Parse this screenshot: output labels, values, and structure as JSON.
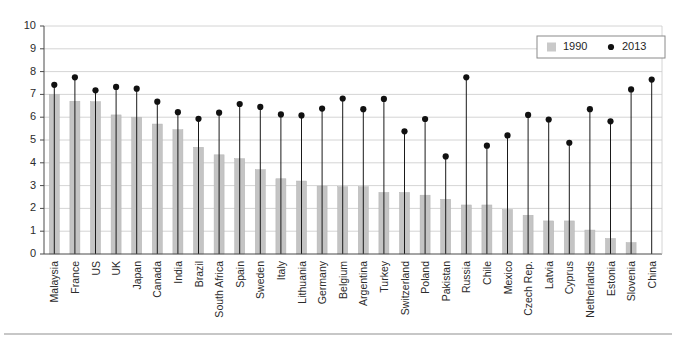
{
  "chart_data": {
    "type": "bar",
    "title": "",
    "xlabel": "",
    "ylabel": "",
    "ylim": [
      0,
      10
    ],
    "ytick_labels": [
      "0",
      "1",
      "2",
      "3",
      "4",
      "5",
      "6",
      "7",
      "8",
      "9",
      "10"
    ],
    "yticks": [
      0,
      1,
      2,
      3,
      4,
      5,
      6,
      7,
      8,
      9,
      10
    ],
    "grid": true,
    "legend_position": "top-right",
    "legend": [
      {
        "name": "1990",
        "marker": "square",
        "color": "#c9c9c9"
      },
      {
        "name": "2013",
        "marker": "dot",
        "color": "#111111"
      }
    ],
    "categories": [
      "Malaysia",
      "France",
      "US",
      "UK",
      "Japan",
      "Canada",
      "India",
      "Brazil",
      "South Africa",
      "Spain",
      "Sweden",
      "Italy",
      "Lithuania",
      "Germany",
      "Belgium",
      "Argentina",
      "Turkey",
      "Switzerland",
      "Poland",
      "Pakistan",
      "Russia",
      "Chile",
      "Mexico",
      "Czech Rep.",
      "Latvia",
      "Cyprus",
      "Netherlands",
      "Estonia",
      "Slovenia",
      "China"
    ],
    "series": [
      {
        "name": "1990",
        "type": "bar",
        "values": [
          7.0,
          6.7,
          6.68,
          6.1,
          6.0,
          5.7,
          5.45,
          4.68,
          4.35,
          4.18,
          3.7,
          3.3,
          3.2,
          2.98,
          2.95,
          2.95,
          2.7,
          2.7,
          2.58,
          2.4,
          2.15,
          2.15,
          1.95,
          1.7,
          1.45,
          1.45,
          1.05,
          0.68,
          0.5,
          0.0
        ]
      },
      {
        "name": "2013",
        "type": "scatter",
        "values": [
          7.42,
          7.75,
          7.18,
          7.33,
          7.25,
          6.68,
          6.22,
          5.93,
          6.2,
          6.58,
          6.45,
          6.12,
          6.08,
          6.38,
          6.82,
          6.35,
          6.8,
          5.38,
          5.92,
          4.28,
          7.75,
          4.75,
          5.2,
          6.1,
          5.9,
          4.88,
          6.35,
          5.82,
          7.22,
          7.65
        ]
      }
    ]
  },
  "legend": {
    "item_1990": "1990",
    "item_2013": "2013"
  },
  "axis": {
    "y_labels": [
      "10",
      "9",
      "8",
      "7",
      "6",
      "5",
      "4",
      "3",
      "2",
      "1",
      "0"
    ]
  }
}
